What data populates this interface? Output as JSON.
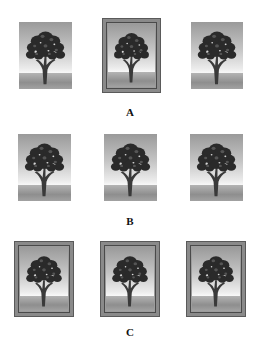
{
  "figure": {
    "rows": [
      {
        "label": "A",
        "items": [
          {
            "name": "tree-image",
            "framed": false
          },
          {
            "name": "tree-image",
            "framed": true
          },
          {
            "name": "tree-image",
            "framed": false
          }
        ]
      },
      {
        "label": "B",
        "items": [
          {
            "name": "tree-image",
            "framed": false
          },
          {
            "name": "tree-image",
            "framed": false
          },
          {
            "name": "tree-image",
            "framed": false
          }
        ]
      },
      {
        "label": "C",
        "items": [
          {
            "name": "tree-image",
            "framed": true
          },
          {
            "name": "tree-image",
            "framed": true
          },
          {
            "name": "tree-image",
            "framed": true
          }
        ]
      }
    ]
  },
  "colors": {
    "frame": "#8a8a8a",
    "sky_top": "#9a9a9a",
    "ground": "#8e8e8e",
    "tree": "#2a2a2a"
  }
}
